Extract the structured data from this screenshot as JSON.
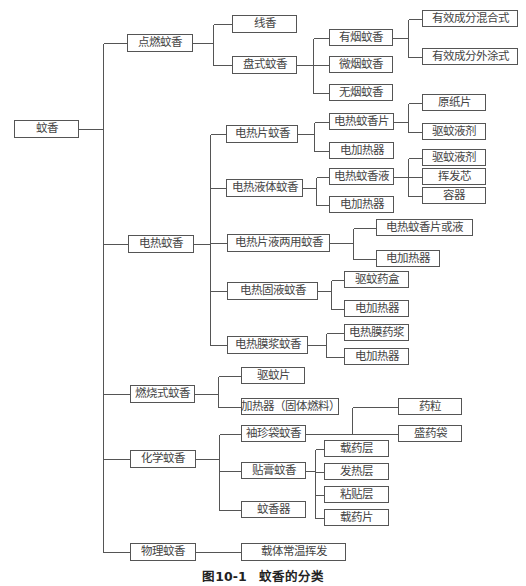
{
  "diagram": {
    "type": "tree",
    "root": "蚊香",
    "caption": {
      "number": "图10-1",
      "title": "蚊香的分类"
    },
    "nodes": [
      {
        "id": "root",
        "label": "蚊香",
        "x": 14,
        "y": 120,
        "w": 65,
        "h": 18
      },
      {
        "id": "n_dianran",
        "label": "点燃蚊香",
        "x": 127,
        "y": 34,
        "w": 66,
        "h": 18
      },
      {
        "id": "n_xianxiang",
        "label": "线香",
        "x": 232,
        "y": 15,
        "w": 65,
        "h": 18
      },
      {
        "id": "n_panshi",
        "label": "盘式蚊香",
        "x": 232,
        "y": 56,
        "w": 65,
        "h": 18
      },
      {
        "id": "n_youyan",
        "label": "有烟蚊香",
        "x": 329,
        "y": 29,
        "w": 64,
        "h": 17
      },
      {
        "id": "n_hunhe",
        "label": "有效成分混合式",
        "x": 422,
        "y": 10,
        "w": 96,
        "h": 17
      },
      {
        "id": "n_waitu",
        "label": "有效成分外涂式",
        "x": 422,
        "y": 48,
        "w": 96,
        "h": 17
      },
      {
        "id": "n_weiyan",
        "label": "微烟蚊香",
        "x": 329,
        "y": 56,
        "w": 64,
        "h": 17
      },
      {
        "id": "n_wuyan",
        "label": "无烟蚊香",
        "x": 329,
        "y": 84,
        "w": 64,
        "h": 17
      },
      {
        "id": "n_dianre",
        "label": "电热蚊香",
        "x": 128,
        "y": 235,
        "w": 66,
        "h": 18
      },
      {
        "id": "n_repian",
        "label": "电热片蚊香",
        "x": 226,
        "y": 125,
        "w": 72,
        "h": 18
      },
      {
        "id": "n_repian_1",
        "label": "电热蚊香片",
        "x": 329,
        "y": 113,
        "w": 65,
        "h": 17
      },
      {
        "id": "n_yuanzhi",
        "label": "原纸片",
        "x": 422,
        "y": 94,
        "w": 64,
        "h": 17
      },
      {
        "id": "n_qwyj_1",
        "label": "驱蚊液剂",
        "x": 422,
        "y": 123,
        "w": 64,
        "h": 17
      },
      {
        "id": "n_jrq_1",
        "label": "电加热器",
        "x": 329,
        "y": 142,
        "w": 65,
        "h": 17
      },
      {
        "id": "n_yeti",
        "label": "电热液体蚊香",
        "x": 226,
        "y": 179,
        "w": 77,
        "h": 18
      },
      {
        "id": "n_xiangye",
        "label": "电热蚊香液",
        "x": 329,
        "y": 168,
        "w": 65,
        "h": 17
      },
      {
        "id": "n_qwyj_2",
        "label": "驱蚊液剂",
        "x": 422,
        "y": 149,
        "w": 64,
        "h": 17
      },
      {
        "id": "n_huifaxin",
        "label": "挥发芯",
        "x": 422,
        "y": 168,
        "w": 64,
        "h": 17
      },
      {
        "id": "n_rongqi",
        "label": "容器",
        "x": 422,
        "y": 187,
        "w": 64,
        "h": 17
      },
      {
        "id": "n_jrq_2",
        "label": "电加热器",
        "x": 329,
        "y": 196,
        "w": 65,
        "h": 17
      },
      {
        "id": "n_liangyong",
        "label": "电热片液两用蚊香",
        "x": 227,
        "y": 234,
        "w": 103,
        "h": 18
      },
      {
        "id": "n_pianhuoye",
        "label": "电热蚊香片或液",
        "x": 376,
        "y": 219,
        "w": 97,
        "h": 17
      },
      {
        "id": "n_jrq_3",
        "label": "电加热器",
        "x": 376,
        "y": 250,
        "w": 64,
        "h": 17
      },
      {
        "id": "n_guye",
        "label": "电热固液蚊香",
        "x": 227,
        "y": 282,
        "w": 91,
        "h": 18
      },
      {
        "id": "n_yaohe",
        "label": "驱蚊药盒",
        "x": 344,
        "y": 271,
        "w": 65,
        "h": 17
      },
      {
        "id": "n_jrq_4",
        "label": "电加热器",
        "x": 344,
        "y": 300,
        "w": 65,
        "h": 17
      },
      {
        "id": "n_mojiang",
        "label": "电热膜浆蚊香",
        "x": 227,
        "y": 336,
        "w": 81,
        "h": 18
      },
      {
        "id": "n_moyaojiang",
        "label": "电热膜药浆",
        "x": 344,
        "y": 324,
        "w": 65,
        "h": 17
      },
      {
        "id": "n_jrq_5",
        "label": "电加热器",
        "x": 344,
        "y": 348,
        "w": 65,
        "h": 17
      },
      {
        "id": "n_ranshao",
        "label": "燃烧式蚊香",
        "x": 130,
        "y": 385,
        "w": 65,
        "h": 18
      },
      {
        "id": "n_qwp",
        "label": "驱蚊片",
        "x": 241,
        "y": 367,
        "w": 64,
        "h": 17
      },
      {
        "id": "n_jrq_gt",
        "label": "加热器（固体燃料）",
        "x": 241,
        "y": 398,
        "w": 98,
        "h": 17
      },
      {
        "id": "n_huaxue",
        "label": "化学蚊香",
        "x": 130,
        "y": 450,
        "w": 66,
        "h": 18
      },
      {
        "id": "n_xiuzhen",
        "label": "袖珍袋蚊香",
        "x": 241,
        "y": 425,
        "w": 65,
        "h": 17
      },
      {
        "id": "n_yaoli",
        "label": "药粒",
        "x": 398,
        "y": 398,
        "w": 64,
        "h": 17
      },
      {
        "id": "n_shengyaodai",
        "label": "盛药袋",
        "x": 398,
        "y": 425,
        "w": 64,
        "h": 17
      },
      {
        "id": "n_tiegao",
        "label": "贴膏蚊香",
        "x": 241,
        "y": 462,
        "w": 65,
        "h": 17
      },
      {
        "id": "n_zaiyaoceng",
        "label": "载药层",
        "x": 324,
        "y": 440,
        "w": 65,
        "h": 17
      },
      {
        "id": "n_farceng",
        "label": "发热层",
        "x": 324,
        "y": 463,
        "w": 65,
        "h": 17
      },
      {
        "id": "n_niantie",
        "label": "粘贴层",
        "x": 324,
        "y": 486,
        "w": 65,
        "h": 17
      },
      {
        "id": "n_zaiyaopian",
        "label": "载药片",
        "x": 324,
        "y": 509,
        "w": 65,
        "h": 17
      },
      {
        "id": "n_wenxiangqi",
        "label": "蚊香器",
        "x": 241,
        "y": 501,
        "w": 65,
        "h": 17
      },
      {
        "id": "n_wuli",
        "label": "物理蚊香",
        "x": 130,
        "y": 543,
        "w": 66,
        "h": 18
      },
      {
        "id": "n_changwen",
        "label": "载体常温挥发",
        "x": 241,
        "y": 543,
        "w": 105,
        "h": 18
      }
    ],
    "edges": [
      [
        "root",
        [
          "n_dianran",
          "n_dianre",
          "n_ranshao",
          "n_huaxue",
          "n_wuli"
        ]
      ],
      [
        "n_dianran",
        [
          "n_xianxiang",
          "n_panshi"
        ]
      ],
      [
        "n_panshi",
        [
          "n_youyan",
          "n_weiyan",
          "n_wuyan"
        ]
      ],
      [
        "n_youyan",
        [
          "n_hunhe",
          "n_waitu"
        ]
      ],
      [
        "n_dianre",
        [
          "n_repian",
          "n_yeti",
          "n_liangyong",
          "n_guye",
          "n_mojiang"
        ]
      ],
      [
        "n_repian",
        [
          "n_repian_1",
          "n_jrq_1"
        ]
      ],
      [
        "n_repian_1",
        [
          "n_yuanzhi",
          "n_qwyj_1"
        ]
      ],
      [
        "n_yeti",
        [
          "n_xiangye",
          "n_jrq_2"
        ]
      ],
      [
        "n_xiangye",
        [
          "n_qwyj_2",
          "n_huifaxin",
          "n_rongqi"
        ]
      ],
      [
        "n_liangyong",
        [
          "n_pianhuoye",
          "n_jrq_3"
        ]
      ],
      [
        "n_guye",
        [
          "n_yaohe",
          "n_jrq_4"
        ]
      ],
      [
        "n_mojiang",
        [
          "n_moyaojiang",
          "n_jrq_5"
        ]
      ],
      [
        "n_ranshao",
        [
          "n_qwp",
          "n_jrq_gt"
        ]
      ],
      [
        "n_huaxue",
        [
          "n_xiuzhen",
          "n_tiegao",
          "n_wenxiangqi"
        ]
      ],
      [
        "n_xiuzhen",
        [
          "n_yaoli",
          "n_shengyaodai"
        ]
      ],
      [
        "n_tiegao",
        [
          "n_zaiyaoceng",
          "n_farceng",
          "n_niantie",
          "n_zaiyaopian"
        ]
      ],
      [
        "n_wuli",
        [
          "n_changwen"
        ]
      ]
    ],
    "colors": {
      "line": "#555555",
      "text": "#444444",
      "background": "#ffffff"
    }
  }
}
